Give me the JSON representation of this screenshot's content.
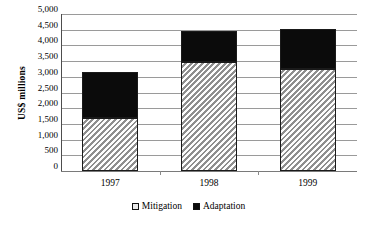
{
  "chart_data": {
    "type": "bar",
    "stacked": true,
    "title": "",
    "xlabel": "",
    "ylabel": "US$ millions",
    "categories": [
      "1997",
      "1998",
      "1999"
    ],
    "series": [
      {
        "name": "Mitigation",
        "values": [
          1700,
          3480,
          3260
        ],
        "color": "#d4d4d4",
        "pattern": "diagonal-hatch"
      },
      {
        "name": "Adaptation",
        "values": [
          1450,
          970,
          1260
        ],
        "color": "#000000",
        "pattern": "solid"
      }
    ],
    "totals": [
      3150,
      4450,
      4520
    ],
    "ylim": [
      0,
      5000
    ],
    "ytick_step": 500,
    "ytick_labels": [
      "0",
      "500",
      "1,000",
      "1,500",
      "2,000",
      "2,500",
      "3,000",
      "3,500",
      "4,000",
      "4,500",
      "5,000"
    ],
    "grid": true,
    "legend_position": "bottom"
  },
  "axis": {
    "y_title": "US$ millions"
  },
  "legend": {
    "entries": [
      {
        "label": "Mitigation"
      },
      {
        "label": "Adaptation"
      }
    ]
  }
}
